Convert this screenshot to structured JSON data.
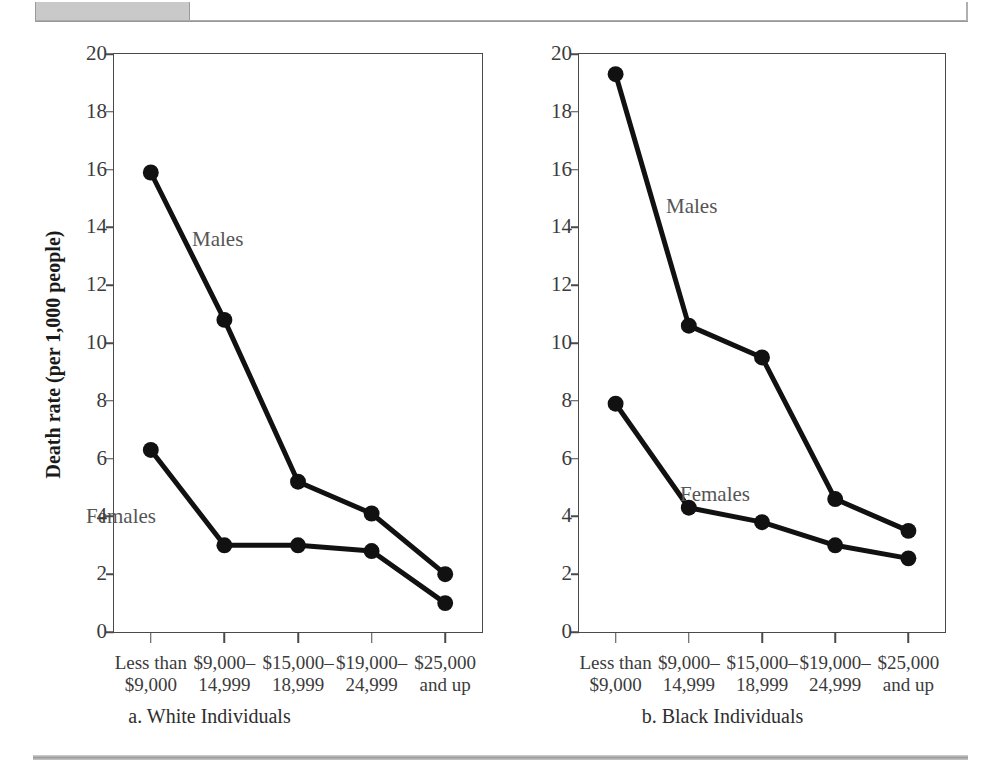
{
  "figure": {
    "background": "#ffffff",
    "series_color": "#111111",
    "axis_color": "#4a4a4a",
    "rule_color": "#a8a8a8"
  },
  "axis": {
    "ylabel": "Death rate (per 1,000 people)",
    "yticks": [
      "0",
      "2",
      "4",
      "6",
      "8",
      "10",
      "12",
      "14",
      "16",
      "18",
      "20"
    ],
    "ymin": 0,
    "ymax": 20,
    "xticks": [
      {
        "line1": "Less than",
        "line2": "$9,000"
      },
      {
        "line1": "$9,000–",
        "line2": "14,999"
      },
      {
        "line1": "$15,000–",
        "line2": "18,999"
      },
      {
        "line1": "$19,000–",
        "line2": "24,999"
      },
      {
        "line1": "$25,000",
        "line2": "and up"
      }
    ]
  },
  "panels": [
    {
      "id": "white",
      "caption": "a. White Individuals",
      "males_label": "Males",
      "females_label": "Females",
      "males_label_pos": {
        "x": 78,
        "y": 175
      },
      "females_label_pos": {
        "x": -28,
        "y": 452
      }
    },
    {
      "id": "black",
      "caption": "b. Black Individuals",
      "males_label": "Males",
      "females_label": "Females",
      "males_label_pos": {
        "x": 87,
        "y": 142
      },
      "females_label_pos": {
        "x": 101,
        "y": 430
      }
    }
  ],
  "chart_data": [
    {
      "type": "line",
      "title": "a. White Individuals",
      "xlabel": "",
      "ylabel": "Death rate (per 1,000 people)",
      "ylim": [
        0,
        20
      ],
      "grid": false,
      "legend": "inline annotations",
      "categories": [
        "Less than $9,000",
        "$9,000–14,999",
        "$15,000–18,999",
        "$19,000–24,999",
        "$25,000 and up"
      ],
      "series": [
        {
          "name": "Males",
          "values": [
            15.9,
            10.8,
            5.2,
            4.1,
            2.0
          ]
        },
        {
          "name": "Females",
          "values": [
            6.3,
            3.0,
            3.0,
            2.8,
            1.0
          ]
        }
      ]
    },
    {
      "type": "line",
      "title": "b. Black Individuals",
      "xlabel": "",
      "ylabel": "Death rate (per 1,000 people)",
      "ylim": [
        0,
        20
      ],
      "grid": false,
      "legend": "inline annotations",
      "categories": [
        "Less than $9,000",
        "$9,000–14,999",
        "$15,000–18,999",
        "$19,000–24,999",
        "$25,000 and up"
      ],
      "series": [
        {
          "name": "Males",
          "values": [
            19.3,
            10.6,
            9.5,
            4.6,
            3.5
          ]
        },
        {
          "name": "Females",
          "values": [
            7.9,
            4.3,
            3.8,
            3.0,
            2.55
          ]
        }
      ]
    }
  ]
}
